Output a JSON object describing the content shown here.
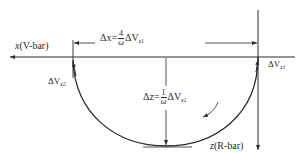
{
  "diagram": {
    "type": "orbital-relative-motion",
    "colors": {
      "line": "#2a2a2a",
      "background": "#ffffff"
    },
    "axes": {
      "x": {
        "var": "x",
        "name": "(V-bar)"
      },
      "z": {
        "var": "z",
        "name": "(R-bar)"
      }
    },
    "labels": {
      "dv_left": {
        "delta": "ΔV",
        "sub": "z2"
      },
      "dv_right": {
        "delta": "ΔV",
        "sub": "z1"
      },
      "dx": {
        "lhs": "Δx=",
        "num": "4",
        "den": "ω",
        "delta": "ΔV",
        "sub": "z1"
      },
      "dz": {
        "lhs": "Δz=",
        "num": "1",
        "den": "ω",
        "delta": "ΔV",
        "sub": "z1"
      }
    }
  }
}
